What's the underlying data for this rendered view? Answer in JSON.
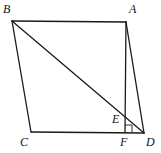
{
  "figure": {
    "type": "geometry",
    "points": {
      "A": {
        "x": 126,
        "y": 22,
        "label": "A",
        "lx": 129,
        "ly": 13
      },
      "B": {
        "x": 12,
        "y": 21,
        "label": "B",
        "lx": 3,
        "ly": 13
      },
      "C": {
        "x": 31,
        "y": 132,
        "label": "C",
        "lx": 20,
        "ly": 146
      },
      "D": {
        "x": 144,
        "y": 133,
        "label": "D",
        "lx": 146,
        "ly": 146
      },
      "E": {
        "x": 125,
        "y": 115,
        "label": "E",
        "lx": 112,
        "ly": 123
      },
      "F": {
        "x": 125,
        "y": 132,
        "label": "F",
        "lx": 120,
        "ly": 146
      }
    },
    "segments": [
      [
        "B",
        "A"
      ],
      [
        "A",
        "D"
      ],
      [
        "D",
        "C"
      ],
      [
        "C",
        "B"
      ],
      [
        "B",
        "D"
      ],
      [
        "A",
        "F"
      ]
    ],
    "right_angle_marker": {
      "at": "F",
      "size": 7
    },
    "stroke_color": "#1a1a1a"
  }
}
